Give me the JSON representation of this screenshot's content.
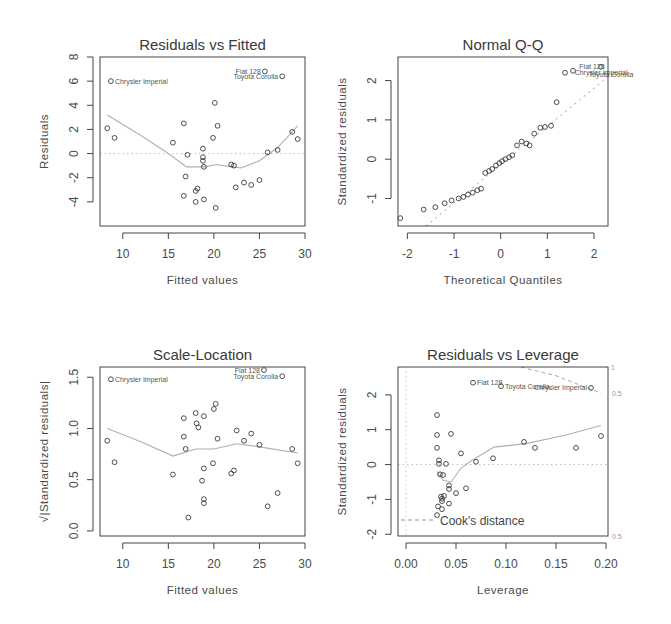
{
  "chart_data": [
    {
      "type": "scatter",
      "title": "Residuals vs Fitted",
      "xlabel": "Fitted values",
      "ylabel": "Residuals",
      "xlim": [
        7.5,
        30
      ],
      "ylim": [
        -6,
        8
      ],
      "xticks": [
        10,
        15,
        20,
        25,
        30
      ],
      "yticks": [
        -4,
        -2,
        0,
        2,
        4,
        6,
        8
      ],
      "reference_line": {
        "y": 0,
        "style": "dotted"
      },
      "points": [
        [
          8.3,
          2.1
        ],
        [
          9.1,
          1.3
        ],
        [
          8.7,
          6.0
        ],
        [
          15.5,
          0.9
        ],
        [
          16.7,
          2.5
        ],
        [
          16.7,
          -3.5
        ],
        [
          16.9,
          -1.9
        ],
        [
          17.1,
          -0.1
        ],
        [
          18.0,
          -4.0
        ],
        [
          18.0,
          -3.1
        ],
        [
          18.2,
          -2.9
        ],
        [
          18.8,
          0.4
        ],
        [
          18.8,
          -0.3
        ],
        [
          18.8,
          -0.6
        ],
        [
          18.9,
          -1.1
        ],
        [
          18.9,
          -3.8
        ],
        [
          19.9,
          1.3
        ],
        [
          20.1,
          4.2
        ],
        [
          20.2,
          -4.5
        ],
        [
          20.4,
          2.3
        ],
        [
          21.9,
          -0.9
        ],
        [
          22.2,
          -1.0
        ],
        [
          22.4,
          -2.8
        ],
        [
          23.3,
          -2.4
        ],
        [
          24.1,
          -2.6
        ],
        [
          25.0,
          -2.2
        ],
        [
          25.6,
          6.8
        ],
        [
          25.9,
          0.1
        ],
        [
          27.0,
          0.3
        ],
        [
          27.5,
          6.4
        ],
        [
          28.6,
          1.8
        ],
        [
          29.2,
          1.2
        ]
      ],
      "smooth_line": [
        [
          8.3,
          3.2
        ],
        [
          12,
          1.5
        ],
        [
          15,
          0.0
        ],
        [
          17,
          -1.1
        ],
        [
          19,
          -1.1
        ],
        [
          20.3,
          -0.9
        ],
        [
          21,
          -1.0
        ],
        [
          23,
          -1.2
        ],
        [
          25,
          -0.6
        ],
        [
          27,
          0.5
        ],
        [
          29.2,
          2.3
        ]
      ],
      "labels": [
        {
          "text": "Chrysler Imperial",
          "x": 8.7,
          "y": 6.0
        },
        {
          "text": "Fiat 128",
          "x": 25.6,
          "y": 6.8
        },
        {
          "text": "Toyota Corolla",
          "x": 27.5,
          "y": 6.4
        }
      ]
    },
    {
      "type": "scatter",
      "title": "Normal Q-Q",
      "xlabel": "Theoretical Quantiles",
      "ylabel": "Standardized residuals",
      "xlim": [
        -2.2,
        2.3
      ],
      "ylim": [
        -1.7,
        2.6
      ],
      "xticks": [
        -2,
        -1,
        0,
        1,
        2
      ],
      "yticks": [
        -1,
        0,
        1,
        2
      ],
      "reference_line": {
        "from": [
          -1.6,
          -1.7
        ],
        "to": [
          2.3,
          2.1
        ],
        "style": "dotted"
      },
      "points": [
        [
          -2.15,
          -1.5
        ],
        [
          -1.65,
          -1.28
        ],
        [
          -1.4,
          -1.22
        ],
        [
          -1.2,
          -1.12
        ],
        [
          -1.05,
          -1.05
        ],
        [
          -0.9,
          -1.0
        ],
        [
          -0.8,
          -0.96
        ],
        [
          -0.7,
          -0.9
        ],
        [
          -0.6,
          -0.85
        ],
        [
          -0.5,
          -0.79
        ],
        [
          -0.42,
          -0.75
        ],
        [
          -0.33,
          -0.35
        ],
        [
          -0.25,
          -0.3
        ],
        [
          -0.18,
          -0.25
        ],
        [
          -0.1,
          -0.16
        ],
        [
          -0.03,
          -0.1
        ],
        [
          0.03,
          -0.05
        ],
        [
          0.1,
          0.0
        ],
        [
          0.18,
          0.05
        ],
        [
          0.25,
          0.1
        ],
        [
          0.35,
          0.35
        ],
        [
          0.45,
          0.45
        ],
        [
          0.55,
          0.4
        ],
        [
          0.62,
          0.35
        ],
        [
          0.72,
          0.65
        ],
        [
          0.85,
          0.8
        ],
        [
          0.95,
          0.82
        ],
        [
          1.08,
          0.85
        ],
        [
          1.2,
          1.45
        ],
        [
          1.38,
          2.2
        ],
        [
          1.55,
          2.25
        ],
        [
          2.15,
          2.35
        ]
      ],
      "labels": [
        {
          "text": "Fiat 128",
          "x": 1.6,
          "y": 2.35
        },
        {
          "text": "Toyota Corolla",
          "x": 1.8,
          "y": 2.15
        },
        {
          "text": "Chrysler Imperial",
          "x": 1.5,
          "y": 2.2
        }
      ]
    },
    {
      "type": "scatter",
      "title": "Scale-Location",
      "xlabel": "Fitted values",
      "ylabel": "√|Standardized residuals|",
      "xlim": [
        7.5,
        30
      ],
      "ylim": [
        -0.05,
        1.6
      ],
      "xticks": [
        10,
        15,
        20,
        25,
        30
      ],
      "yticks": [
        "0.0",
        "0.5",
        "1.0",
        "1.5"
      ],
      "points": [
        [
          8.3,
          0.88
        ],
        [
          9.1,
          0.67
        ],
        [
          8.7,
          1.48
        ],
        [
          15.5,
          0.55
        ],
        [
          16.7,
          1.1
        ],
        [
          16.7,
          0.92
        ],
        [
          16.9,
          0.8
        ],
        [
          17.2,
          0.13
        ],
        [
          18.0,
          1.15
        ],
        [
          18.1,
          1.05
        ],
        [
          18.3,
          1.01
        ],
        [
          18.7,
          0.49
        ],
        [
          18.9,
          0.61
        ],
        [
          18.9,
          0.31
        ],
        [
          18.9,
          0.27
        ],
        [
          18.9,
          1.12
        ],
        [
          19.9,
          0.66
        ],
        [
          20.0,
          1.19
        ],
        [
          20.2,
          1.24
        ],
        [
          20.4,
          0.9
        ],
        [
          21.9,
          0.56
        ],
        [
          22.2,
          0.59
        ],
        [
          22.5,
          0.98
        ],
        [
          23.3,
          0.88
        ],
        [
          24.1,
          0.95
        ],
        [
          25.0,
          0.84
        ],
        [
          25.5,
          1.57
        ],
        [
          25.9,
          0.24
        ],
        [
          27.0,
          0.37
        ],
        [
          27.5,
          1.51
        ],
        [
          28.6,
          0.8
        ],
        [
          29.2,
          0.66
        ]
      ],
      "smooth_line": [
        [
          8.3,
          1.0
        ],
        [
          12,
          0.87
        ],
        [
          15.5,
          0.73
        ],
        [
          18,
          0.8
        ],
        [
          20,
          0.8
        ],
        [
          22.5,
          0.85
        ],
        [
          25,
          0.82
        ],
        [
          29.2,
          0.76
        ]
      ],
      "labels": [
        {
          "text": "Chrysler Imperial",
          "x": 8.7,
          "y": 1.48
        },
        {
          "text": "Fiat 128",
          "x": 25.5,
          "y": 1.57
        },
        {
          "text": "Toyota Corolla",
          "x": 27.5,
          "y": 1.51
        }
      ]
    },
    {
      "type": "scatter",
      "title": "Residuals vs Leverage",
      "xlabel": "Leverage",
      "ylabel": "Standardized residuals",
      "xlim": [
        -0.008,
        0.202
      ],
      "ylim": [
        -2.05,
        2.8
      ],
      "xticks": [
        "0.00",
        "0.05",
        "0.10",
        "0.15",
        "0.20"
      ],
      "yticks": [
        -2,
        -1,
        0,
        1,
        2
      ],
      "reference_line": {
        "y": 0,
        "style": "dotted"
      },
      "points": [
        [
          0.031,
          1.42
        ],
        [
          0.031,
          0.85
        ],
        [
          0.031,
          0.48
        ],
        [
          0.031,
          -1.45
        ],
        [
          0.032,
          -1.2
        ],
        [
          0.033,
          0.12
        ],
        [
          0.033,
          0.02
        ],
        [
          0.034,
          -0.28
        ],
        [
          0.035,
          -0.92
        ],
        [
          0.036,
          -0.98
        ],
        [
          0.036,
          -1.05
        ],
        [
          0.036,
          -1.28
        ],
        [
          0.037,
          -0.3
        ],
        [
          0.038,
          -0.9
        ],
        [
          0.04,
          0.02
        ],
        [
          0.043,
          -0.6
        ],
        [
          0.043,
          -0.7
        ],
        [
          0.043,
          -1.12
        ],
        [
          0.045,
          0.88
        ],
        [
          0.05,
          -0.82
        ],
        [
          0.055,
          0.32
        ],
        [
          0.06,
          -0.68
        ],
        [
          0.07,
          0.08
        ],
        [
          0.087,
          0.18
        ],
        [
          0.118,
          0.65
        ],
        [
          0.129,
          0.48
        ],
        [
          0.17,
          0.48
        ],
        [
          0.195,
          0.82
        ],
        [
          0.067,
          2.35
        ],
        [
          0.095,
          2.25
        ],
        [
          0.185,
          2.2
        ]
      ],
      "smooth_line": [
        [
          0.031,
          -0.2
        ],
        [
          0.037,
          -0.45
        ],
        [
          0.045,
          -0.5
        ],
        [
          0.055,
          -0.1
        ],
        [
          0.065,
          0.1
        ],
        [
          0.088,
          0.5
        ],
        [
          0.12,
          0.6
        ],
        [
          0.16,
          0.85
        ],
        [
          0.195,
          1.12
        ]
      ],
      "cooks_distance": {
        "legend_label": "Cook's distance",
        "contour_labels_right": [
          "1",
          "0.5",
          "0.5"
        ],
        "upper_curve": [
          [
            0.115,
            2.8
          ],
          [
            0.15,
            2.55
          ],
          [
            0.195,
            2.05
          ]
        ]
      },
      "labels": [
        {
          "text": "Fiat 128",
          "x": 0.067,
          "y": 2.35
        },
        {
          "text": "Toyota Corolla",
          "x": 0.095,
          "y": 2.25
        },
        {
          "text": "Chrysler Imperial",
          "x": 0.185,
          "y": 2.2
        }
      ]
    }
  ]
}
